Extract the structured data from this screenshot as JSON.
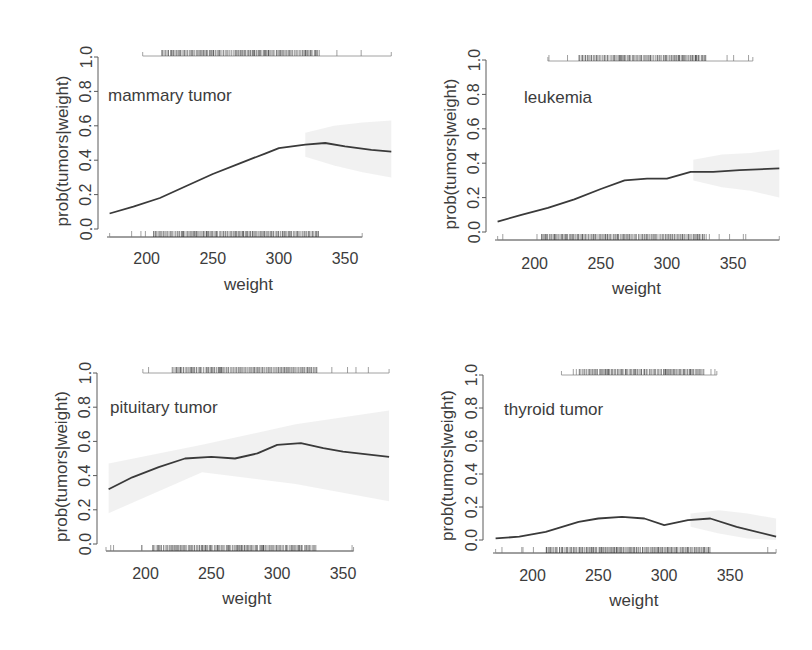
{
  "figure": {
    "background": "#ffffff",
    "line_color": "#3a3a3a",
    "axis_color": "#5a5a5a",
    "band_color": "#ededed",
    "rug_color": "#2e2e2e"
  },
  "chart_data": [
    {
      "type": "line",
      "title": "mammary tumor",
      "xlabel": "weight",
      "ylabel": "prob(tumors|weight)",
      "xlim": [
        170,
        385
      ],
      "ylim": [
        0,
        1
      ],
      "xticks": [
        200,
        250,
        300,
        350
      ],
      "yticks": [
        "0.0",
        "0.2",
        "0.4",
        "0.6",
        "0.8",
        "1.0"
      ],
      "x": [
        172,
        190,
        210,
        230,
        250,
        270,
        290,
        300,
        320,
        335,
        350,
        370,
        385
      ],
      "y": [
        0.09,
        0.13,
        0.18,
        0.25,
        0.32,
        0.38,
        0.44,
        0.47,
        0.49,
        0.5,
        0.48,
        0.46,
        0.45
      ],
      "band_from_x": 320,
      "band_upper": [
        0.56,
        0.6,
        0.62,
        0.63
      ],
      "band_lower": [
        0.42,
        0.37,
        0.33,
        0.3
      ],
      "rug_top": {
        "min": 197,
        "max": 385,
        "dense_from": 212,
        "dense_to": 330
      },
      "rug_bottom": {
        "min": 172,
        "max": 363,
        "dense_from": 205,
        "dense_to": 330
      },
      "label_pos": {
        "x": 108,
        "y": 101
      }
    },
    {
      "type": "line",
      "title": "leukemia",
      "xlabel": "weight",
      "ylabel": "prob(tumors|weight)",
      "xlim": [
        170,
        385
      ],
      "ylim": [
        0,
        1
      ],
      "xticks": [
        200,
        250,
        300,
        350
      ],
      "yticks": [
        "0.0",
        "0.2",
        "0.4",
        "0.6",
        "0.8",
        "1.0"
      ],
      "x": [
        172,
        190,
        210,
        230,
        250,
        268,
        285,
        300,
        318,
        335,
        355,
        385
      ],
      "y": [
        0.06,
        0.1,
        0.14,
        0.19,
        0.25,
        0.3,
        0.31,
        0.31,
        0.35,
        0.35,
        0.36,
        0.37
      ],
      "band_from_x": 320,
      "band_upper": [
        0.42,
        0.45,
        0.46,
        0.48
      ],
      "band_lower": [
        0.3,
        0.26,
        0.24,
        0.2
      ],
      "rug_top": {
        "min": 210,
        "max": 365,
        "dense_from": 233,
        "dense_to": 330
      },
      "rug_bottom": {
        "min": 172,
        "max": 385,
        "dense_from": 205,
        "dense_to": 330
      },
      "label_pos": {
        "x": 524,
        "y": 103
      }
    },
    {
      "type": "line",
      "title": "pituitary tumor",
      "xlabel": "weight",
      "ylabel": "prob(tumors|weight)",
      "xlim": [
        170,
        385
      ],
      "ylim": [
        0,
        1
      ],
      "xticks": [
        200,
        250,
        300,
        350
      ],
      "yticks": [
        "0.0",
        "0.2",
        "0.4",
        "0.6",
        "0.8",
        "1.0"
      ],
      "x": [
        172,
        190,
        210,
        230,
        250,
        268,
        285,
        300,
        318,
        335,
        350,
        385
      ],
      "y": [
        0.32,
        0.39,
        0.45,
        0.5,
        0.51,
        0.5,
        0.53,
        0.58,
        0.59,
        0.56,
        0.54,
        0.51
      ],
      "band_from_x": 172,
      "band_upper": [
        0.47,
        0.58,
        0.7,
        0.78
      ],
      "band_lower": [
        0.18,
        0.42,
        0.35,
        0.25
      ],
      "rug_top": {
        "min": 198,
        "max": 385,
        "dense_from": 220,
        "dense_to": 330
      },
      "rug_bottom": {
        "min": 170,
        "max": 358,
        "dense_from": 205,
        "dense_to": 330
      },
      "label_pos": {
        "x": 110,
        "y": 413
      }
    },
    {
      "type": "line",
      "title": "thyroid tumor",
      "xlabel": "weight",
      "ylabel": "prob(tumors|weight)",
      "xlim": [
        170,
        385
      ],
      "ylim": [
        0,
        1
      ],
      "xticks": [
        200,
        250,
        300,
        350
      ],
      "yticks": [
        "0.0",
        "0.2",
        "0.4",
        "0.6",
        "0.8",
        "1.0"
      ],
      "x": [
        172,
        190,
        210,
        235,
        250,
        268,
        285,
        300,
        318,
        335,
        355,
        385
      ],
      "y": [
        0.01,
        0.02,
        0.05,
        0.11,
        0.13,
        0.14,
        0.13,
        0.09,
        0.12,
        0.13,
        0.08,
        0.02
      ],
      "band_from_x": 320,
      "band_upper": [
        0.16,
        0.18,
        0.16,
        0.13
      ],
      "band_lower": [
        0.08,
        0.04,
        0.01,
        0.0
      ],
      "rug_top": {
        "min": 222,
        "max": 340,
        "dense_from": 235,
        "dense_to": 330
      },
      "rug_bottom": {
        "min": 172,
        "max": 385,
        "dense_from": 210,
        "dense_to": 335
      },
      "label_pos": {
        "x": 504,
        "y": 415
      }
    }
  ],
  "panels_layout": [
    {
      "yaxis_x": 98,
      "ytop": 57,
      "ybot": 229,
      "xaxis_y": 237,
      "x0px": 107,
      "x350px": 345,
      "ylabel_x": 62,
      "xtick_y": 264,
      "xlabel_y": 290,
      "toprug_y": 52
    },
    {
      "yaxis_x": 486,
      "ytop": 60,
      "ybot": 232,
      "xaxis_y": 240,
      "x0px": 495,
      "x350px": 733,
      "ylabel_x": 450,
      "xtick_y": 269,
      "xlabel_y": 294,
      "toprug_y": 57
    },
    {
      "yaxis_x": 97,
      "ytop": 373,
      "ybot": 544,
      "xaxis_y": 551,
      "x0px": 106,
      "x350px": 343,
      "ylabel_x": 61,
      "xtick_y": 579,
      "xlabel_y": 604,
      "toprug_y": 369
    },
    {
      "yaxis_x": 483,
      "ytop": 375,
      "ybot": 540,
      "xaxis_y": 553,
      "x0px": 493,
      "x350px": 730,
      "ylabel_x": 447,
      "xtick_y": 581,
      "xlabel_y": 606,
      "toprug_y": 371
    }
  ]
}
